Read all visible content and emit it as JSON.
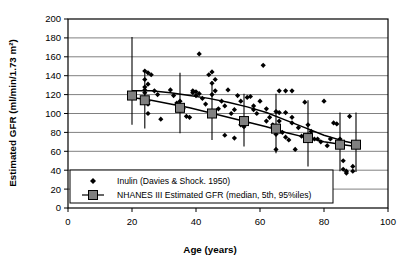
{
  "chart_data": {
    "type": "scatter",
    "title": "",
    "xlabel": "Age (years)",
    "ylabel": "Estimated GFR (ml/min/1.73 m²)",
    "xlim": [
      0,
      100
    ],
    "ylim": [
      0,
      200
    ],
    "xticks": [
      0,
      20,
      40,
      60,
      80,
      100
    ],
    "yticks": [
      0,
      20,
      40,
      60,
      80,
      100,
      120,
      140,
      160,
      180,
      200
    ],
    "grid": "horizontal",
    "legend_position": "lower-left-inside",
    "legend": [
      {
        "label": "Inulin (Davies & Shock. 1950)",
        "marker": "diamond",
        "color": "#000000"
      },
      {
        "label": "NHANES III Estimated GFR (median, 5th, 95%iles)",
        "marker": "square-with-errorbar",
        "color": "#808080"
      }
    ],
    "series": [
      {
        "name": "NHANES III Estimated GFR (median, 5th, 95%iles)",
        "type": "marker-with-errorbars",
        "marker": "square",
        "marker_color": "#808080",
        "marker_edge": "#000000",
        "x": [
          20,
          24,
          35,
          45,
          55,
          65,
          75,
          85,
          90
        ],
        "median": [
          119,
          114,
          106,
          100,
          92,
          84,
          74,
          67,
          67
        ],
        "p5": [
          88,
          84,
          79,
          72,
          65,
          58,
          44,
          39,
          38
        ],
        "p95": [
          181,
          146,
          143,
          134,
          121,
          121,
          114,
          101,
          101
        ]
      },
      {
        "name": "Inulin (Davies & Shock. 1950)",
        "type": "scatter",
        "marker": "diamond",
        "marker_color": "#000000",
        "points": [
          [
            24,
            145
          ],
          [
            24,
            136
          ],
          [
            24,
            128
          ],
          [
            24,
            125
          ],
          [
            24,
            122
          ],
          [
            25,
            143
          ],
          [
            25,
            131
          ],
          [
            25,
            113
          ],
          [
            25,
            110
          ],
          [
            25,
            100
          ],
          [
            26,
            141
          ],
          [
            27,
            124
          ],
          [
            28,
            120
          ],
          [
            29,
            94
          ],
          [
            32,
            125
          ],
          [
            33,
            119
          ],
          [
            34,
            111
          ],
          [
            35,
            113
          ],
          [
            36,
            105
          ],
          [
            37,
            97
          ],
          [
            38,
            96
          ],
          [
            39,
            122
          ],
          [
            39,
            124
          ],
          [
            40,
            123
          ],
          [
            40,
            119
          ],
          [
            41,
            163
          ],
          [
            41,
            121
          ],
          [
            42,
            116
          ],
          [
            43,
            110
          ],
          [
            44,
            141
          ],
          [
            45,
            144
          ],
          [
            45,
            132
          ],
          [
            45,
            120
          ],
          [
            46,
            136
          ],
          [
            46,
            124
          ],
          [
            47,
            105
          ],
          [
            48,
            113
          ],
          [
            49,
            108
          ],
          [
            49,
            77
          ],
          [
            50,
            125
          ],
          [
            51,
            100
          ],
          [
            52,
            104
          ],
          [
            52,
            74
          ],
          [
            53,
            119
          ],
          [
            54,
            113
          ],
          [
            54,
            88
          ],
          [
            55,
            86
          ],
          [
            56,
            117
          ],
          [
            56,
            90
          ],
          [
            57,
            118
          ],
          [
            58,
            108
          ],
          [
            58,
            104
          ],
          [
            59,
            100
          ],
          [
            60,
            113
          ],
          [
            61,
            151
          ],
          [
            62,
            105
          ],
          [
            62,
            92
          ],
          [
            63,
            96
          ],
          [
            64,
            88
          ],
          [
            64,
            86
          ],
          [
            65,
            102
          ],
          [
            65,
            78
          ],
          [
            65,
            62
          ],
          [
            66,
            124
          ],
          [
            66,
            101
          ],
          [
            66,
            92
          ],
          [
            67,
            80
          ],
          [
            68,
            124
          ],
          [
            68,
            101
          ],
          [
            68,
            75
          ],
          [
            69,
            72
          ],
          [
            70,
            124
          ],
          [
            70,
            96
          ],
          [
            70,
            90
          ],
          [
            71,
            62
          ],
          [
            72,
            85
          ],
          [
            73,
            76
          ],
          [
            74,
            112
          ],
          [
            75,
            88
          ],
          [
            76,
            81
          ],
          [
            77,
            73
          ],
          [
            78,
            73
          ],
          [
            79,
            70
          ],
          [
            80,
            113
          ],
          [
            81,
            66
          ],
          [
            82,
            73
          ],
          [
            83,
            90
          ],
          [
            84,
            89
          ],
          [
            85,
            73
          ],
          [
            85,
            67
          ],
          [
            86,
            50
          ],
          [
            86,
            41
          ],
          [
            87,
            39
          ],
          [
            87,
            37
          ],
          [
            88,
            97
          ],
          [
            89,
            44
          ],
          [
            89,
            39
          ]
        ]
      },
      {
        "name": "upper trend curve",
        "type": "line",
        "points": [
          [
            20,
            124
          ],
          [
            26,
            124
          ],
          [
            32,
            122
          ],
          [
            38,
            119
          ],
          [
            44,
            116
          ],
          [
            50,
            112
          ],
          [
            56,
            107
          ],
          [
            62,
            101
          ],
          [
            68,
            93
          ],
          [
            74,
            85
          ],
          [
            80,
            77
          ],
          [
            86,
            71
          ],
          [
            90,
            68
          ]
        ]
      },
      {
        "name": "lower trend curve",
        "type": "line",
        "points": [
          [
            20,
            117
          ],
          [
            26,
            114
          ],
          [
            32,
            110
          ],
          [
            38,
            106
          ],
          [
            44,
            101
          ],
          [
            50,
            96
          ],
          [
            56,
            91
          ],
          [
            62,
            86
          ],
          [
            68,
            80
          ],
          [
            74,
            75
          ],
          [
            80,
            70
          ],
          [
            86,
            67
          ],
          [
            90,
            65
          ]
        ]
      }
    ]
  },
  "colors": {
    "gridline": "#808080",
    "axis": "#000000",
    "marker_fill": "#808080",
    "background": "#ffffff"
  }
}
